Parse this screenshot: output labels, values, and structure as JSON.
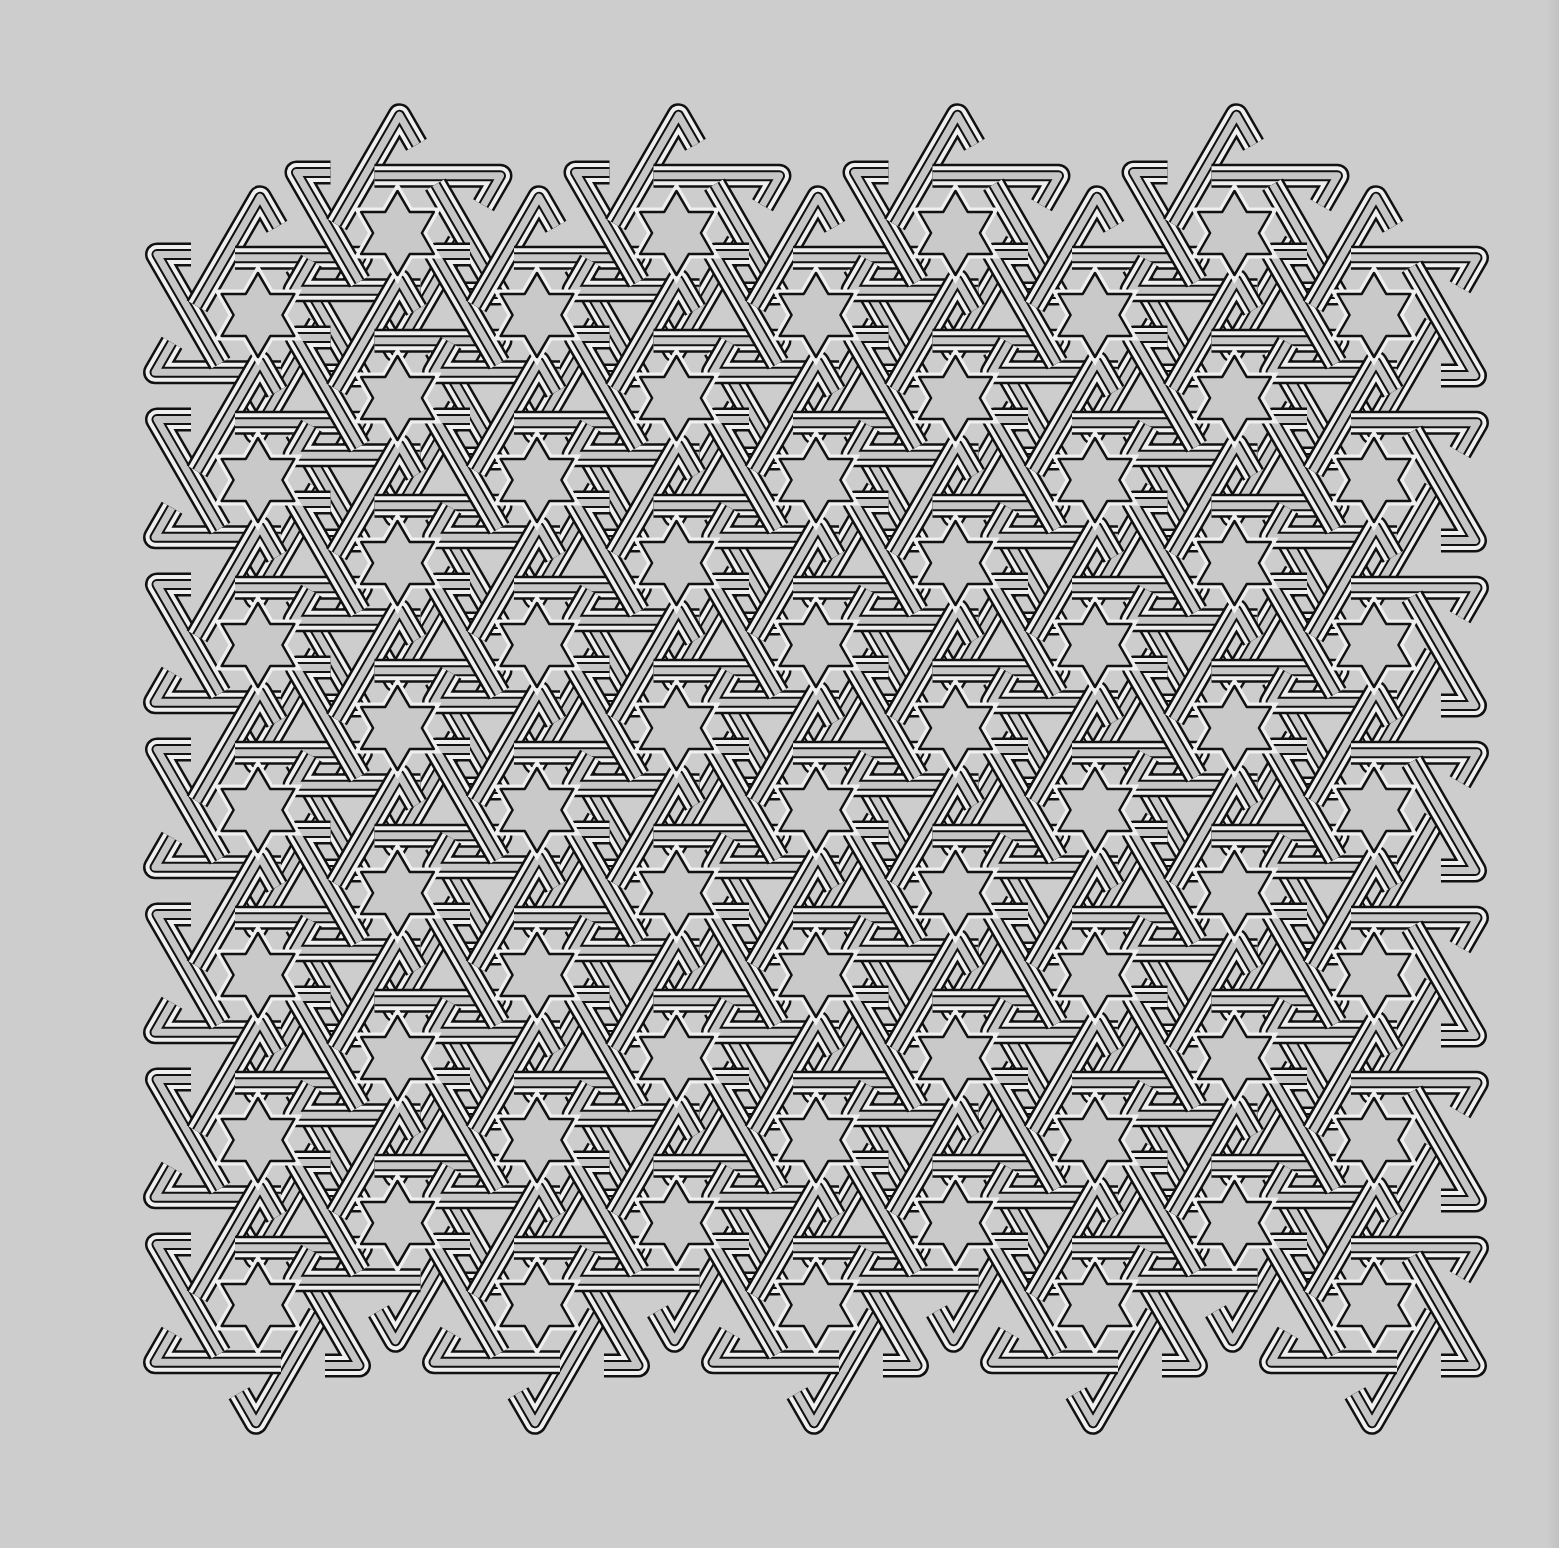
{
  "artwork": {
    "title": "Interlaced six-point star labyrinth pattern",
    "background_color": "#cdcdcd",
    "band_outline_color": "#111111",
    "band_fill_color": "#efefef",
    "band_inner_stripe_color": "#c6c6c6",
    "star_fill_color": "#c9c9c9"
  },
  "lattice": {
    "origin_x": 258,
    "origin_y": 315,
    "column_spacing": 139.5,
    "row_spacing": 165,
    "odd_column_y_offset": -82,
    "columns": 9,
    "rows": 7,
    "star_radius": 42
  },
  "band": {
    "outer_width": 24,
    "white_width": 19,
    "inner_black_width": 11,
    "inner_stripe_width": 7,
    "ring_radius": 66,
    "extension": 70
  }
}
